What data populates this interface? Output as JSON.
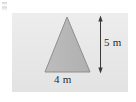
{
  "figure": {
    "kind": "geometry-diagram",
    "shape": "triangle",
    "panel": {
      "background_color": "#e9e9e9",
      "x": 12,
      "y": 13,
      "width": 116,
      "height": 79
    },
    "triangle": {
      "fill_color": "#b9b9b9",
      "stroke_color": "#8c8c8c",
      "apex": {
        "x": 67,
        "y": 17
      },
      "base_left": {
        "x": 45,
        "y": 72
      },
      "base_right": {
        "x": 90,
        "y": 72
      }
    },
    "dimensions": [
      {
        "name": "height",
        "value": 5,
        "unit": "m",
        "label": "5 m",
        "orientation": "vertical",
        "line": {
          "x": 100,
          "y1": 17,
          "y2": 72
        },
        "arrows": "both",
        "color": "#333333"
      },
      {
        "name": "base",
        "value": 4,
        "unit": "m",
        "label": "4 m",
        "orientation": "horizontal",
        "color": "#333333"
      }
    ]
  }
}
